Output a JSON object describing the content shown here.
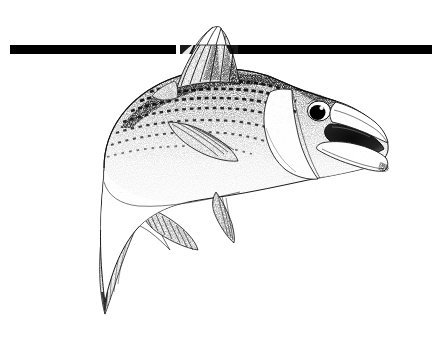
{
  "page": {
    "title": "Striped Bass Illustration",
    "background_color": "#ffffff",
    "width": 447,
    "height": 338,
    "description": "Black-and-white stippled pen-and-ink drawing of a striped bass leaping to the right with its mouth open, overlaid by a solid black horizontal rule."
  },
  "divider": {
    "name": "black-horizontal-rule",
    "color": "#000000",
    "x_start": 10,
    "x_end": 432,
    "y_top": 45,
    "thickness": 9,
    "interrupted_by": "dorsal-fin",
    "gap_x_start": 176,
    "gap_x_end": 238
  },
  "illustration": {
    "subject": "striped bass",
    "style": "stipple / pen-and-ink",
    "ink_color": "#111111",
    "paper_color": "#ffffff",
    "orientation": "facing right, body arched, tail lowered at left",
    "parts": [
      {
        "name": "body",
        "label": "Body"
      },
      {
        "name": "head",
        "label": "Head"
      },
      {
        "name": "eye",
        "label": "Eye"
      },
      {
        "name": "open-mouth",
        "label": "Open mouth"
      },
      {
        "name": "lower-jaw",
        "label": "Lower jaw"
      },
      {
        "name": "gill-cover",
        "label": "Operculum"
      },
      {
        "name": "spiny-dorsal-fin",
        "label": "Spiny dorsal fin"
      },
      {
        "name": "soft-dorsal-fin",
        "label": "Soft dorsal fin"
      },
      {
        "name": "pectoral-fin",
        "label": "Pectoral fin"
      },
      {
        "name": "pelvic-fin",
        "label": "Pelvic fin"
      },
      {
        "name": "anal-fin",
        "label": "Anal fin"
      },
      {
        "name": "caudal-fin",
        "label": "Caudal fin"
      },
      {
        "name": "lateral-stripes",
        "label": "Lateral stripes"
      }
    ],
    "stripe_count": 7,
    "dorsal_spine_count": 8
  }
}
